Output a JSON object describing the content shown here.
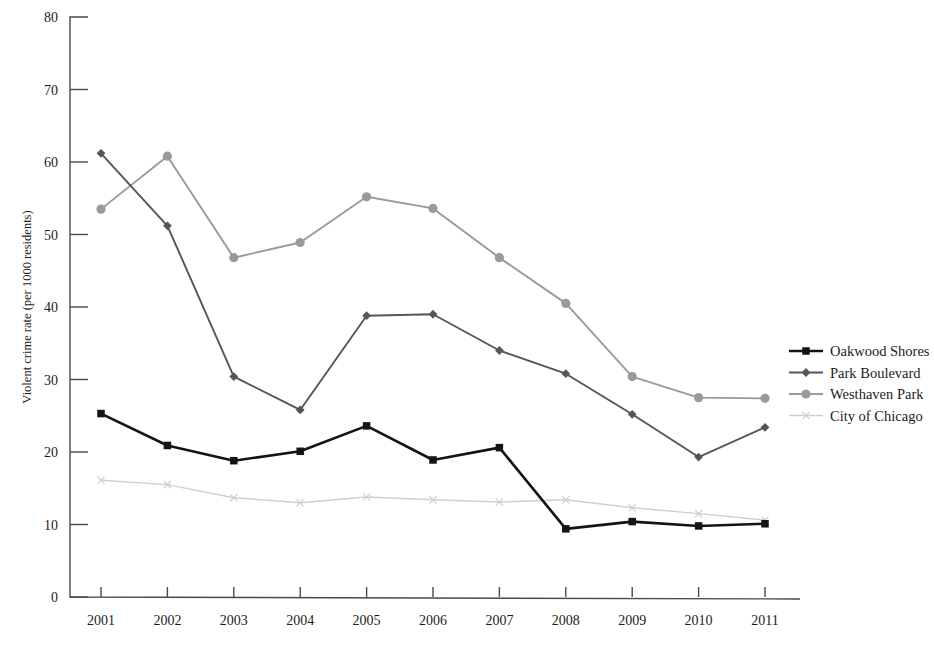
{
  "chart_data": {
    "type": "line",
    "title": "",
    "xlabel": "",
    "ylabel": "Violent crime rate (per 1000 residents)",
    "categories": [
      "2001",
      "2002",
      "2003",
      "2004",
      "2005",
      "2006",
      "2007",
      "2008",
      "2009",
      "2010",
      "2011"
    ],
    "ylim": [
      0,
      80
    ],
    "yticks": [
      "0",
      "10",
      "20",
      "30",
      "40",
      "50",
      "60",
      "70",
      "80"
    ],
    "grid": false,
    "legend_position": "right",
    "series": [
      {
        "name": "Oakwood Shores",
        "color": "#141414",
        "marker": "square",
        "values": [
          25.3,
          20.9,
          18.8,
          20.1,
          23.6,
          18.9,
          20.6,
          9.4,
          10.4,
          9.8,
          10.1
        ]
      },
      {
        "name": "Park Boulevard",
        "color": "#555555",
        "marker": "diamond",
        "values": [
          61.2,
          51.2,
          30.4,
          25.8,
          38.8,
          39.0,
          34.0,
          30.8,
          25.2,
          19.3,
          23.4
        ]
      },
      {
        "name": "Westhaven Park",
        "color": "#9a9a9a",
        "marker": "circle",
        "values": [
          53.5,
          60.8,
          46.8,
          48.9,
          55.2,
          53.6,
          46.8,
          40.5,
          30.4,
          27.5,
          27.4
        ]
      },
      {
        "name": "City of Chicago",
        "color": "#cfcfcf",
        "marker": "x",
        "values": [
          16.1,
          15.5,
          13.7,
          13.0,
          13.8,
          13.4,
          13.1,
          13.4,
          12.3,
          11.5,
          10.6
        ]
      }
    ]
  },
  "legend": {
    "items": [
      {
        "label": "Oakwood Shores"
      },
      {
        "label": "Park Boulevard"
      },
      {
        "label": "Westhaven Park"
      },
      {
        "label": "City of Chicago"
      }
    ]
  },
  "axes": {
    "y_title": "Violent crime rate (per 1000 residents)"
  }
}
